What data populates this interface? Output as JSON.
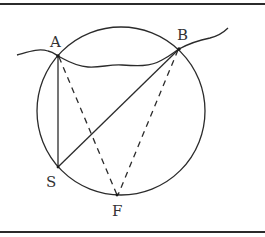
{
  "diagram": {
    "type": "geometry",
    "colors": {
      "stroke": "#2b2b2b",
      "label": "#333333",
      "background": "#ffffff"
    },
    "circle": {
      "cx": 121,
      "cy": 111,
      "r": 84
    },
    "points": [
      {
        "id": "A",
        "label": "A",
        "x": 58,
        "y": 56,
        "label_x": 50,
        "label_y": 47
      },
      {
        "id": "B",
        "label": "B",
        "x": 179,
        "y": 49,
        "label_x": 177,
        "label_y": 40
      },
      {
        "id": "S",
        "label": "S",
        "x": 58,
        "y": 167,
        "label_x": 46,
        "label_y": 187
      },
      {
        "id": "F",
        "label": "F",
        "x": 117,
        "y": 195,
        "label_x": 112,
        "label_y": 216
      }
    ],
    "segments": [
      {
        "from": "A",
        "to": "S",
        "style": "solid"
      },
      {
        "from": "S",
        "to": "B",
        "style": "solid"
      },
      {
        "from": "A",
        "to": "F",
        "style": "dashed"
      },
      {
        "from": "B",
        "to": "F",
        "style": "dashed"
      }
    ],
    "curve": {
      "name": "wavy-line",
      "style": "solid",
      "passes_through": [
        "A",
        "B"
      ]
    }
  }
}
